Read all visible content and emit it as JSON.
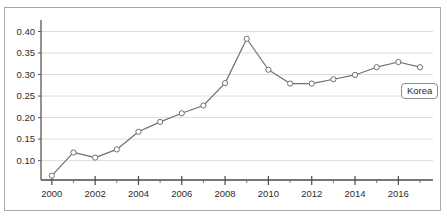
{
  "figure": {
    "top_caption_fragment": "",
    "border_color": "#a8a8ac",
    "background_color": "#ffffff"
  },
  "legend": {
    "label": "Korea",
    "position": "inside-right"
  },
  "chart_data": {
    "type": "line",
    "title": "",
    "subtitle": "",
    "xlabel": "",
    "ylabel": "",
    "x": [
      2000,
      2001,
      2002,
      2003,
      2004,
      2005,
      2006,
      2007,
      2008,
      2009,
      2010,
      2011,
      2012,
      2013,
      2014,
      2015,
      2016,
      2017
    ],
    "series": [
      {
        "name": "Korea",
        "values": [
          0.065,
          0.119,
          0.107,
          0.126,
          0.167,
          0.19,
          0.21,
          0.228,
          0.28,
          0.383,
          0.311,
          0.279,
          0.279,
          0.289,
          0.299,
          0.317,
          0.329,
          0.317
        ],
        "color": "#6f6f74",
        "marker": "open-circle",
        "marker_fill": "#ffffff"
      }
    ],
    "xlim": [
      1999.5,
      2017.6
    ],
    "ylim": [
      0.055,
      0.415
    ],
    "xticks": [
      2000,
      2002,
      2004,
      2006,
      2008,
      2010,
      2012,
      2014,
      2016
    ],
    "xtick_labels": [
      "2000",
      "2002",
      "2004",
      "2006",
      "2008",
      "2010",
      "2012",
      "2014",
      "2016"
    ],
    "xtick_minor": [
      2001,
      2003,
      2005,
      2007,
      2009,
      2011,
      2013,
      2015,
      2017
    ],
    "yticks": [
      0.1,
      0.15,
      0.2,
      0.25,
      0.3,
      0.35,
      0.4
    ],
    "ytick_labels": [
      "0.10",
      "0.15",
      "0.20",
      "0.25",
      "0.30",
      "0.35",
      "0.40"
    ],
    "grid": "horizontal",
    "grid_color": "#dcdcdc",
    "legend_position": "inside-right",
    "annotations": [
      {
        "text": "Korea",
        "x": 2016.2,
        "y": 0.285
      }
    ]
  }
}
